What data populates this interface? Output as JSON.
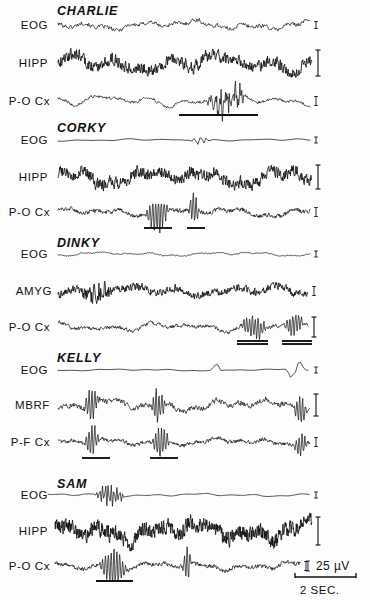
{
  "figure": {
    "background_color": "#fdfdfd",
    "trace_color": "#111111"
  },
  "calibration": {
    "amplitude_label": "25 µV",
    "amplitude_marker": "I",
    "time_label": "2 SEC.",
    "time_bar_x_start": 295,
    "time_bar_x_end": 356,
    "time_bar_y": 577
  },
  "chart_data": {
    "type": "line",
    "xlabel": "2 SEC.",
    "ylabel": "25 µV",
    "grid": false,
    "legend": "none",
    "x_axis": {
      "units": "seconds",
      "scale_bar_seconds": 2
    },
    "y_axis": {
      "units": "microvolts",
      "scale_bar_microvolts": 25
    },
    "subjects": [
      {
        "name": "CHARLIE",
        "name_x": 57,
        "name_y": 11,
        "channels": [
          {
            "label": "EOG",
            "label_x": 48,
            "baseline_y": 25,
            "x_start": 58,
            "x_end": 310,
            "amplitude": 5.0,
            "roughness": "high",
            "density": 1.5,
            "seed": 101,
            "calibration": "tick",
            "cal_height": 7,
            "underlines": []
          },
          {
            "label": "HIPP",
            "label_x": 48,
            "baseline_y": 63,
            "x_start": 58,
            "x_end": 312,
            "amplitude": 9.5,
            "roughness": "very-high",
            "density": 2.1,
            "seed": 202,
            "calibration": "bracket",
            "cal_height": 26,
            "underlines": []
          },
          {
            "label": "P-O Cx",
            "label_x": 50,
            "baseline_y": 101,
            "x_start": 58,
            "x_end": 310,
            "amplitude": 6.0,
            "roughness": "medium",
            "density": 1.6,
            "seed": 303,
            "calibration": "tick",
            "cal_height": 9,
            "burst": {
              "x_start": 205,
              "x_end": 250,
              "amplitude": 15
            },
            "underlines": [
              {
                "x_start": 179,
                "x_end": 258,
                "y": 115,
                "double": false
              }
            ]
          }
        ]
      },
      {
        "name": "CORKY",
        "name_x": 57,
        "name_y": 128,
        "channels": [
          {
            "label": "EOG",
            "label_x": 48,
            "baseline_y": 140,
            "x_start": 58,
            "x_end": 310,
            "amplitude": 1.2,
            "roughness": "low",
            "density": 0.5,
            "seed": 404,
            "calibration": "tick",
            "cal_height": 6,
            "burst": {
              "x_start": 190,
              "x_end": 212,
              "amplitude": 7
            },
            "underlines": []
          },
          {
            "label": "HIPP",
            "label_x": 48,
            "baseline_y": 177,
            "x_start": 58,
            "x_end": 312,
            "amplitude": 9.0,
            "roughness": "very-high",
            "density": 2.4,
            "seed": 505,
            "calibration": "bracket",
            "cal_height": 24,
            "underlines": []
          },
          {
            "label": "P-O Cx",
            "label_x": 50,
            "baseline_y": 212,
            "x_start": 58,
            "x_end": 310,
            "amplitude": 5.0,
            "roughness": "high",
            "density": 2.2,
            "seed": 606,
            "calibration": "tick",
            "cal_height": 9,
            "spindles": [
              {
                "x_start": 145,
                "x_end": 170,
                "amplitude": 15
              },
              {
                "x_start": 188,
                "x_end": 200,
                "amplitude": 14
              }
            ],
            "underlines": [
              {
                "x_start": 144,
                "x_end": 172,
                "y": 228,
                "double": false
              },
              {
                "x_start": 187,
                "x_end": 205,
                "y": 228,
                "double": false
              }
            ]
          }
        ]
      },
      {
        "name": "DINKY",
        "name_x": 57,
        "name_y": 243,
        "channels": [
          {
            "label": "EOG",
            "label_x": 48,
            "baseline_y": 254,
            "x_start": 58,
            "x_end": 310,
            "amplitude": 2.2,
            "roughness": "medium",
            "density": 1.8,
            "seed": 707,
            "calibration": "tick",
            "cal_height": 6,
            "underlines": []
          },
          {
            "label": "AMYG",
            "label_x": 52,
            "baseline_y": 291,
            "x_start": 58,
            "x_end": 308,
            "amplitude": 5.5,
            "roughness": "very-high",
            "density": 2.2,
            "seed": 808,
            "calibration": "tick",
            "cal_height": 9,
            "burst": {
              "x_start": 80,
              "x_end": 115,
              "amplitude": 10
            },
            "underlines": []
          },
          {
            "label": "P-O Cx",
            "label_x": 50,
            "baseline_y": 327,
            "x_start": 58,
            "x_end": 308,
            "amplitude": 4.5,
            "roughness": "high",
            "density": 2.0,
            "seed": 909,
            "calibration": "bracket",
            "cal_height": 20,
            "spindles": [
              {
                "x_start": 240,
                "x_end": 268,
                "amplitude": 11
              },
              {
                "x_start": 283,
                "x_end": 305,
                "amplitude": 10
              }
            ],
            "underlines": [
              {
                "x_start": 237,
                "x_end": 268,
                "y": 341,
                "double": true
              },
              {
                "x_start": 282,
                "x_end": 312,
                "y": 341,
                "double": true
              }
            ]
          }
        ]
      },
      {
        "name": "KELLY",
        "name_x": 57,
        "name_y": 358,
        "channels": [
          {
            "label": "EOG",
            "label_x": 48,
            "baseline_y": 370,
            "x_start": 58,
            "x_end": 310,
            "amplitude": 1.0,
            "roughness": "low",
            "density": 0.4,
            "seed": 111,
            "calibration": "tick",
            "cal_height": 6,
            "spindles": [
              {
                "x_start": 208,
                "x_end": 224,
                "amplitude": 6
              },
              {
                "x_start": 285,
                "x_end": 307,
                "amplitude": 9
              }
            ],
            "underlines": []
          },
          {
            "label": "MBRF",
            "label_x": 50,
            "baseline_y": 405,
            "x_start": 58,
            "x_end": 310,
            "amplitude": 6.5,
            "roughness": "high",
            "density": 1.7,
            "seed": 222,
            "calibration": "bracket",
            "cal_height": 22,
            "spindles": [
              {
                "x_start": 84,
                "x_end": 100,
                "amplitude": 14
              },
              {
                "x_start": 150,
                "x_end": 166,
                "amplitude": 14
              },
              {
                "x_start": 293,
                "x_end": 308,
                "amplitude": 12
              }
            ],
            "underlines": []
          },
          {
            "label": "P-F Cx",
            "label_x": 50,
            "baseline_y": 442,
            "x_start": 58,
            "x_end": 310,
            "amplitude": 4.2,
            "roughness": "high",
            "density": 2.3,
            "seed": 333,
            "calibration": "tick",
            "cal_height": 9,
            "spindles": [
              {
                "x_start": 84,
                "x_end": 100,
                "amplitude": 13
              },
              {
                "x_start": 151,
                "x_end": 170,
                "amplitude": 13
              },
              {
                "x_start": 294,
                "x_end": 308,
                "amplitude": 11
              }
            ],
            "underlines": [
              {
                "x_start": 82,
                "x_end": 110,
                "y": 458,
                "double": false
              },
              {
                "x_start": 150,
                "x_end": 178,
                "y": 458,
                "double": false
              }
            ]
          }
        ]
      },
      {
        "name": "SAM",
        "name_x": 57,
        "name_y": 484,
        "channels": [
          {
            "label": "EOG",
            "label_x": 48,
            "baseline_y": 495,
            "x_start": 48,
            "x_end": 310,
            "amplitude": 1.6,
            "roughness": "low",
            "density": 0.9,
            "seed": 444,
            "calibration": "tick",
            "cal_height": 6,
            "spindles": [
              {
                "x_start": 95,
                "x_end": 125,
                "amplitude": 11
              }
            ],
            "underlines": []
          },
          {
            "label": "HIPP",
            "label_x": 48,
            "baseline_y": 531,
            "x_start": 55,
            "x_end": 312,
            "amplitude": 11.0,
            "roughness": "very-high",
            "density": 3.2,
            "seed": 555,
            "calibration": "bracket",
            "cal_height": 28,
            "underlines": []
          },
          {
            "label": "P-O Cx",
            "label_x": 50,
            "baseline_y": 566,
            "x_start": 55,
            "x_end": 300,
            "amplitude": 4.5,
            "roughness": "high",
            "density": 2.4,
            "seed": 666,
            "calibration": "tick",
            "cal_height": 9,
            "spindles": [
              {
                "x_start": 98,
                "x_end": 128,
                "amplitude": 15
              },
              {
                "x_start": 182,
                "x_end": 192,
                "amplitude": 13
              }
            ],
            "underlines": [
              {
                "x_start": 96,
                "x_end": 133,
                "y": 581,
                "double": false
              }
            ]
          }
        ]
      }
    ]
  }
}
